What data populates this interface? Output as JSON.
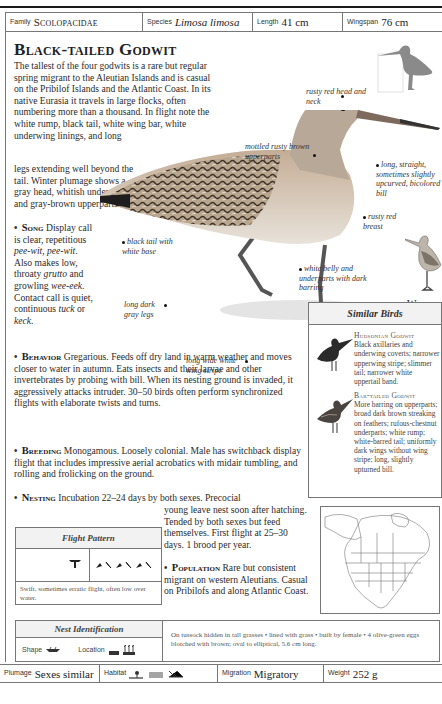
{
  "header_bar": {
    "family_label": "Family",
    "family_value": "Scolopacidae",
    "species_label": "Species",
    "species_value": "Limosa limosa",
    "length_label": "Length",
    "length_value": "41 cm",
    "wingspan_label": "Wingspan",
    "wingspan_value": "76 cm"
  },
  "title": "Black-tailed Godwit",
  "intro": "The tallest of the four godwits is a rare but regular spring migrant to the Aleutian Islands and is casual on the Pribilof Islands and the Atlantic Coast. In its native Eurasia it travels in large flocks, often numbering more than a thousand. In flight note the white rump, black tail, white wing bar, white underwing linings, and long",
  "intro_cont": "legs extending well beyond the tail. Winter plumage shows a gray head, whitish underparts, and gray-brown upperparts.",
  "sections": {
    "song": {
      "heading": "Song",
      "text_1": "Display call is clear, repetitious ",
      "call_1": "pee-wit, pee-wit",
      "text_2": ". Also makes low, throaty ",
      "call_2": "grutto",
      "text_3": " and growling ",
      "call_3": "wee-eek",
      "text_4": ". Contact call is quiet, continuous ",
      "call_4": "tuck",
      "text_5": " or ",
      "call_5": "keck",
      "text_6": "."
    },
    "behavior": {
      "heading": "Behavior",
      "text": "Gregarious. Feeds off dry land in warm weather and moves closer to water in autumn. Eats insects and their larvae and other invertebrates by probing with bill. When its nesting ground is invaded, it aggressively attacks intruder. 30–50 birds often perform synchronized flights with elaborate twists and turns."
    },
    "breeding": {
      "heading": "Breeding",
      "text": "Monogamous. Loosely colonial. Male has switchback display flight that includes impressive aerial acrobatics with midair tumbling, and rolling and frolicking on the ground."
    },
    "nesting": {
      "heading": "Nesting",
      "text_1": "Incubation 22–24 days by both sexes. Precocial",
      "text_2": "young leave nest soon after hatching. Tended by both sexes but feed themselves. First flight at 25–30 days. 1 brood per year."
    },
    "population": {
      "heading": "Population",
      "text": "Rare but consistent migrant on western Aleutians. Casual on Pribilofs and along Atlantic Coast."
    }
  },
  "callouts": {
    "head": "rusty red head and neck",
    "upperparts": "mottled rusty brown upperparts",
    "bill": "long, straight, sometimes slightly upcurved, bicolored bill",
    "breast": "rusty red breast",
    "tail": "black tail with white base",
    "belly": "white belly and underparts with dark barring",
    "legs": "long dark gray legs",
    "wing": "long wide white wing stripe"
  },
  "winter_plumage_label": "Winter Plumage",
  "similar_birds": {
    "heading": "Similar Birds",
    "items": [
      {
        "name": "Hudsonian Godwit",
        "text": "Black axillaries and underwing coverts; narrower upperwing stripe; slimmer tail; narrower white uppertail band."
      },
      {
        "name": "Bar-tailed Godwit",
        "text": "More barring on upperparts; broad dark brown streaking on feathers; rufous-chestnut underparts; white rump; white-barred tail; uniformly dark wings without wing stripe; long, slightly upturned bill."
      }
    ]
  },
  "flight_pattern": {
    "heading": "Flight Pattern",
    "description": "Swift, sometimes erratic flight, often low over water."
  },
  "nest_identification": {
    "heading": "Nest Identification",
    "shape_label": "Shape",
    "location_label": "Location",
    "description": "On tussock hidden in tall grasses • lined with grass • built by female • 4 olive-green eggs blotched with brown; oval to elliptical, 5.6 cm long."
  },
  "footer_bar": {
    "plumage_label": "Plumage",
    "plumage_value": "Sexes similar",
    "habitat_label": "Habitat",
    "migration_label": "Migration",
    "migration_value": "Migratory",
    "weight_label": "Weight",
    "weight_value": "252 g"
  },
  "colors": {
    "text": "#2a2a2a",
    "border": "#777777",
    "header_fill": "#f2f2f2",
    "bird_rust": "#b7876a",
    "silhouette": "#8a8a8a"
  }
}
